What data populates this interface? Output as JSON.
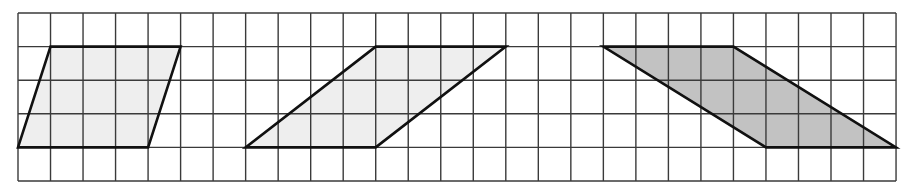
{
  "figure": {
    "grid": {
      "columns": 27,
      "rows": 5,
      "origin_x": 18,
      "origin_y": 13,
      "cell_width": 32.52,
      "cell_height": 33.6,
      "line_color": "#3a3a3a"
    },
    "outline_color": "#111111",
    "parallelograms": [
      {
        "name": "parallelogram-1",
        "fill": "#eeeeee",
        "vertices_grid": [
          [
            0,
            4
          ],
          [
            4,
            4
          ],
          [
            5,
            1
          ],
          [
            1,
            1
          ]
        ]
      },
      {
        "name": "parallelogram-2",
        "fill": "#eeeeee",
        "vertices_grid": [
          [
            7,
            4
          ],
          [
            11,
            4
          ],
          [
            15,
            1
          ],
          [
            11,
            1
          ]
        ]
      },
      {
        "name": "parallelogram-3",
        "fill": "#c2c2c2",
        "vertices_grid": [
          [
            18,
            1
          ],
          [
            22,
            1
          ],
          [
            27,
            4
          ],
          [
            23,
            4
          ]
        ]
      }
    ]
  }
}
